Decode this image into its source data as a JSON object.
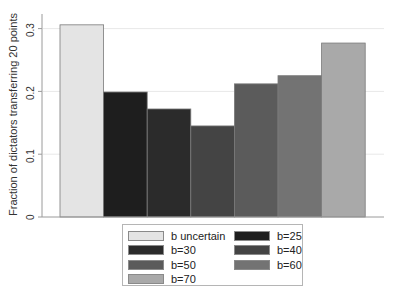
{
  "chart_data": {
    "type": "bar",
    "title": "",
    "xlabel": "",
    "ylabel": "Fraction of dictators transferring 20 points",
    "ylim": [
      0,
      0.32
    ],
    "yticks": [
      0,
      0.1,
      0.2,
      0.3
    ],
    "ytick_labels": [
      "0",
      "0.1",
      "0.2",
      "0.3"
    ],
    "grid": true,
    "legend_position": "bottom",
    "categories": [
      "b uncertain",
      "b=25",
      "b=30",
      "b=40",
      "b=50",
      "b=60",
      "b=70"
    ],
    "values": [
      0.306,
      0.199,
      0.172,
      0.145,
      0.212,
      0.225,
      0.277
    ],
    "colors": [
      "#e4e4e4",
      "#1e1e1e",
      "#2b2b2b",
      "#444444",
      "#5b5b5b",
      "#737373",
      "#a9a9a9"
    ]
  },
  "legend": {
    "items": [
      {
        "label": "b uncertain",
        "color": "#e4e4e4"
      },
      {
        "label": "b=25",
        "color": "#1e1e1e"
      },
      {
        "label": "b=30",
        "color": "#2b2b2b"
      },
      {
        "label": "b=40",
        "color": "#444444"
      },
      {
        "label": "b=50",
        "color": "#5b5b5b"
      },
      {
        "label": "b=60",
        "color": "#737373"
      },
      {
        "label": "b=70",
        "color": "#a9a9a9"
      }
    ]
  }
}
